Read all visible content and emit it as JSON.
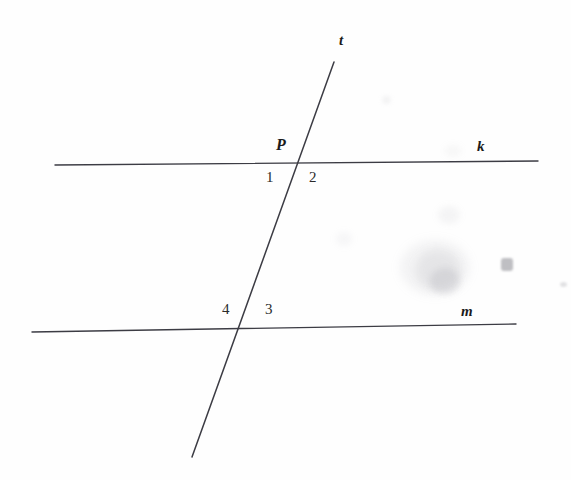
{
  "figure": {
    "background_color": "#fefefe",
    "stroke_color": "#3c3c44",
    "text_color": "#1b1b1b",
    "width": 571,
    "height": 480,
    "lines": [
      {
        "id": "line-k",
        "label": "k",
        "label_x": 477,
        "label_y": 139,
        "x1": 55,
        "y1": 165,
        "x2": 538,
        "y2": 161,
        "stroke_width": 1.4
      },
      {
        "id": "line-m",
        "label": "m",
        "label_x": 461,
        "label_y": 304,
        "x1": 32,
        "y1": 332,
        "x2": 516,
        "y2": 324,
        "stroke_width": 1.4
      },
      {
        "id": "line-t",
        "label": "t",
        "label_x": 339,
        "label_y": 33,
        "x1": 334,
        "y1": 62,
        "x2": 192,
        "y2": 457,
        "stroke_width": 1.5
      }
    ],
    "points": [
      {
        "id": "point-P",
        "label": "P",
        "label_x": 276,
        "label_y": 137,
        "x": 300,
        "y": 160
      }
    ],
    "angle_labels": [
      {
        "id": "angle-1",
        "label": "1",
        "x": 266,
        "y": 170
      },
      {
        "id": "angle-2",
        "label": "2",
        "x": 309,
        "y": 170
      },
      {
        "id": "angle-3",
        "label": "3",
        "x": 265,
        "y": 302
      },
      {
        "id": "angle-4",
        "label": "4",
        "x": 222,
        "y": 302
      }
    ],
    "artifacts": [
      {
        "id": "smudge-1",
        "x": 400,
        "y": 240,
        "w": 70,
        "h": 55,
        "color": "rgba(150,150,155,0.10)"
      },
      {
        "id": "smudge-2",
        "x": 416,
        "y": 250,
        "w": 44,
        "h": 40,
        "color": "rgba(140,140,150,0.13)"
      },
      {
        "id": "smudge-3",
        "x": 430,
        "y": 268,
        "w": 30,
        "h": 26,
        "color": "rgba(130,130,140,0.16)"
      },
      {
        "id": "smudge-4",
        "x": 501,
        "y": 258,
        "w": 12,
        "h": 13,
        "color": "rgba(90,90,100,0.38)"
      },
      {
        "id": "smudge-5",
        "x": 438,
        "y": 206,
        "w": 22,
        "h": 18,
        "color": "rgba(160,160,168,0.10)"
      },
      {
        "id": "smudge-6",
        "x": 336,
        "y": 232,
        "w": 16,
        "h": 14,
        "color": "rgba(165,165,172,0.09)"
      },
      {
        "id": "smudge-7",
        "x": 444,
        "y": 145,
        "w": 18,
        "h": 12,
        "color": "rgba(165,165,172,0.08)"
      },
      {
        "id": "smudge-8",
        "x": 560,
        "y": 282,
        "w": 7,
        "h": 5,
        "color": "rgba(150,150,158,0.28)"
      },
      {
        "id": "smudge-9",
        "x": 382,
        "y": 96,
        "w": 9,
        "h": 8,
        "color": "rgba(170,170,178,0.14)"
      }
    ]
  }
}
